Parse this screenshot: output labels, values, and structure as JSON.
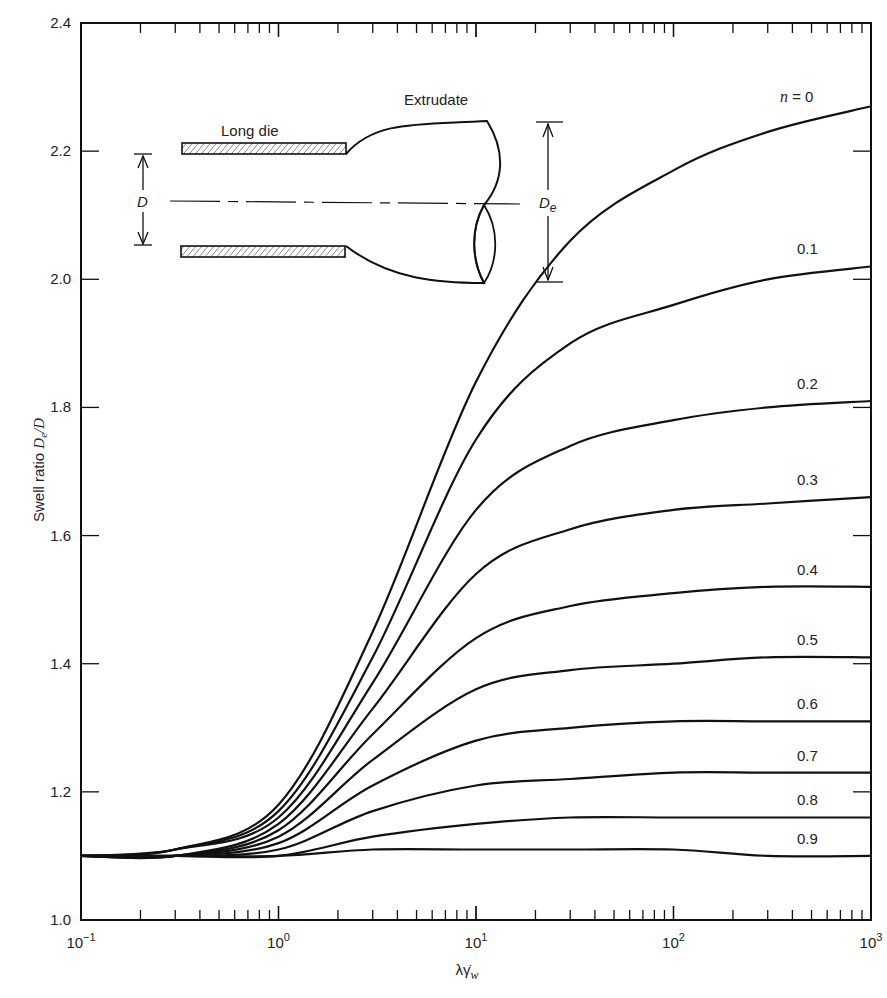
{
  "chart_data": {
    "type": "line",
    "title": "",
    "xlabel": "λγ̇_w",
    "ylabel": "Swell ratio De/D",
    "xscale": "log",
    "xlim": [
      0.1,
      1000
    ],
    "ylim": [
      1.0,
      2.4
    ],
    "grid": false,
    "legend_position": "inline labels at right end of curves",
    "x_tick_labels": [
      "10−1",
      "100",
      "101",
      "102",
      "103"
    ],
    "x_tick_values": [
      0.1,
      1,
      10,
      100,
      1000
    ],
    "y_tick_labels": [
      "1.0",
      "1.2",
      "1.4",
      "1.6",
      "1.8",
      "2.0",
      "2.2",
      "2.4"
    ],
    "y_tick_values": [
      1.0,
      1.2,
      1.4,
      1.6,
      1.8,
      2.0,
      2.2,
      2.4
    ],
    "x": [
      0.1,
      0.3,
      1,
      3,
      10,
      30,
      100,
      300,
      1000
    ],
    "series": [
      {
        "name": "n = 0",
        "values": [
          1.1,
          1.11,
          1.18,
          1.45,
          1.84,
          2.06,
          2.17,
          2.23,
          2.27
        ]
      },
      {
        "name": "0.1",
        "values": [
          1.1,
          1.11,
          1.17,
          1.41,
          1.75,
          1.9,
          1.96,
          2.0,
          2.02
        ]
      },
      {
        "name": "0.2",
        "values": [
          1.1,
          1.11,
          1.16,
          1.37,
          1.64,
          1.74,
          1.78,
          1.8,
          1.81
        ]
      },
      {
        "name": "0.3",
        "values": [
          1.1,
          1.1,
          1.15,
          1.33,
          1.54,
          1.61,
          1.64,
          1.65,
          1.66
        ]
      },
      {
        "name": "0.4",
        "values": [
          1.1,
          1.1,
          1.14,
          1.29,
          1.44,
          1.49,
          1.51,
          1.52,
          1.52
        ]
      },
      {
        "name": "0.5",
        "values": [
          1.1,
          1.1,
          1.13,
          1.25,
          1.36,
          1.39,
          1.4,
          1.41,
          1.41
        ]
      },
      {
        "name": "0.6",
        "values": [
          1.1,
          1.1,
          1.12,
          1.21,
          1.28,
          1.3,
          1.31,
          1.31,
          1.31
        ]
      },
      {
        "name": "0.7",
        "values": [
          1.1,
          1.1,
          1.11,
          1.17,
          1.21,
          1.22,
          1.23,
          1.23,
          1.23
        ]
      },
      {
        "name": "0.8",
        "values": [
          1.1,
          1.1,
          1.1,
          1.13,
          1.15,
          1.16,
          1.16,
          1.16,
          1.16
        ]
      },
      {
        "name": "0.9",
        "values": [
          1.1,
          1.1,
          1.1,
          1.11,
          1.11,
          1.11,
          1.11,
          1.1,
          1.1
        ]
      }
    ],
    "annotations": [
      "Long die",
      "Extrudate",
      "D",
      "De"
    ]
  },
  "axes": {
    "xlabel_main": "λγ̇",
    "xlabel_sub": "w",
    "ylabel_prefix": "Swell ratio ",
    "ylabel_math": "De/D"
  },
  "curve_labels": {
    "n_prefix": "n",
    "n_equals": "=",
    "first_value": "0"
  },
  "inset": {
    "long_die": "Long die",
    "extrudate": "Extrudate",
    "d_label": "D",
    "de_main": "D",
    "de_sub": "e"
  }
}
